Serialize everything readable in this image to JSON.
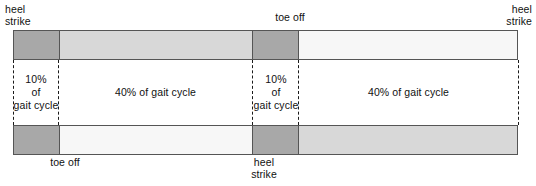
{
  "diagram": {
    "colors": {
      "dark_gray": "#a8a8a8",
      "mid_gray": "#d8d8d8",
      "light_gray": "#efefef",
      "pale_gray": "#f7f7f7",
      "outline": "#555555",
      "text": "#111111"
    }
  },
  "event_labels": [
    {
      "id": "hs-top-left",
      "text": "heel\nstrike"
    },
    {
      "id": "toe-off-top",
      "text": "toe off"
    },
    {
      "id": "hs-top-right",
      "text": "heel\nstrike"
    },
    {
      "id": "toe-off-bottom",
      "text": "toe off"
    },
    {
      "id": "hs-bottom",
      "text": "heel\nstrike"
    }
  ],
  "bars": {
    "top": {
      "name": "right-limb-gait-bar",
      "segments": [
        {
          "label": "stance-double-support-1",
          "percent": 10,
          "color": "#a8a8a8",
          "width_px": 45
        },
        {
          "label": "stance-single-support",
          "percent": 40,
          "color": "#d8d8d8",
          "width_px": 194
        },
        {
          "label": "stance-double-support-2",
          "percent": 10,
          "color": "#a8a8a8",
          "width_px": 46
        },
        {
          "label": "swing",
          "percent": 40,
          "color": "#f7f7f7",
          "width_px": 220
        }
      ]
    },
    "bottom": {
      "name": "left-limb-gait-bar",
      "segments": [
        {
          "label": "stance-double-support-1",
          "percent": 10,
          "color": "#a8a8a8",
          "width_px": 45
        },
        {
          "label": "swing",
          "percent": 40,
          "color": "#f7f7f7",
          "width_px": 194
        },
        {
          "label": "stance-double-support-2",
          "percent": 10,
          "color": "#a8a8a8",
          "width_px": 46
        },
        {
          "label": "stance-single-support",
          "percent": 40,
          "color": "#d8d8d8",
          "width_px": 220
        }
      ]
    }
  },
  "phase_notes": [
    {
      "id": "note-0",
      "text": "10%\nof\ngait cycle"
    },
    {
      "id": "note-1",
      "text": "40% of gait cycle"
    },
    {
      "id": "note-2",
      "text": "10%\nof\ngait cycle"
    },
    {
      "id": "note-3",
      "text": "40% of gait cycle"
    }
  ],
  "guides": [
    {
      "id": "guide-0",
      "x_px": 13
    },
    {
      "id": "guide-1",
      "x_px": 58
    },
    {
      "id": "guide-2",
      "x_px": 252
    },
    {
      "id": "guide-3",
      "x_px": 298
    },
    {
      "id": "guide-4",
      "x_px": 518
    }
  ]
}
